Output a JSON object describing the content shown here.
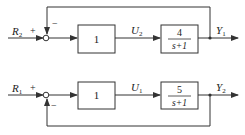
{
  "diagrams": [
    {
      "id": "top",
      "input": {
        "symbol": "R",
        "sub": "2"
      },
      "input_sign": "+",
      "feedback_sign": "−",
      "block1": {
        "label": "1"
      },
      "intermediate": {
        "symbol": "U",
        "sub": "2"
      },
      "block2": {
        "numerator": "4",
        "denominator": "s+1"
      },
      "output": {
        "symbol": "Y",
        "sub": "1"
      },
      "feedback_path": "above"
    },
    {
      "id": "bottom",
      "input": {
        "symbol": "R",
        "sub": "1"
      },
      "input_sign": "+",
      "feedback_sign": "−",
      "block1": {
        "label": "1"
      },
      "intermediate": {
        "symbol": "U",
        "sub": "1"
      },
      "block2": {
        "numerator": "5",
        "denominator": "s+1"
      },
      "output": {
        "symbol": "Y",
        "sub": "2"
      },
      "feedback_path": "below"
    }
  ]
}
